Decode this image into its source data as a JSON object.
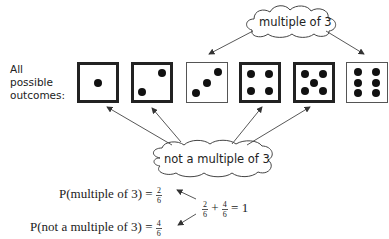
{
  "label": {
    "line1": "All",
    "line2": "possible",
    "line3": "outcomes:"
  },
  "dice": [
    {
      "value": 1,
      "highlight": false
    },
    {
      "value": 2,
      "highlight": false
    },
    {
      "value": 3,
      "highlight": true
    },
    {
      "value": 4,
      "highlight": false
    },
    {
      "value": 5,
      "highlight": false
    },
    {
      "value": 6,
      "highlight": true
    }
  ],
  "clouds": {
    "top": "multiple of 3",
    "bottom": "not a multiple of 3"
  },
  "equations": {
    "p_multiple_label": "P(multiple of 3) =",
    "p_multiple_num": "2",
    "p_multiple_den": "6",
    "p_not_label": "P(not a multiple of 3) =",
    "p_not_num": "4",
    "p_not_den": "6",
    "sum_a_num": "2",
    "sum_a_den": "6",
    "sum_plus": "+",
    "sum_b_num": "4",
    "sum_b_den": "6",
    "sum_equals": "= 1"
  }
}
